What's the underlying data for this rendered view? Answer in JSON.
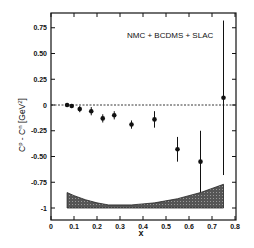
{
  "chart_data": {
    "type": "scatter",
    "title": "",
    "annotation": "NMC + BCDMS + SLAC",
    "xlabel": "x",
    "ylabel": "C^p - C^n [GeV^2]",
    "ylabel_main": "C",
    "ylabel_sup1": "p",
    "ylabel_mid": " - C",
    "ylabel_sup2": "n",
    "ylabel_unit": "[GeV",
    "ylabel_unit_sup": "2",
    "ylabel_unit_close": "]",
    "xlim": [
      0,
      0.8
    ],
    "ylim": [
      -1.1,
      0.92
    ],
    "xticks": [
      0,
      0.1,
      0.2,
      0.3,
      0.4,
      0.5,
      0.6,
      0.7,
      0.8
    ],
    "xtick_labels": [
      "0",
      "0.1",
      "0.2",
      "0.3",
      "0.4",
      "0.5",
      "0.6",
      "0.7",
      "0.8"
    ],
    "yticks": [
      0.75,
      0.5,
      0.25,
      0,
      -0.25,
      -0.5,
      -0.75,
      -1
    ],
    "ytick_labels": [
      "0.75",
      "0.50",
      "0.25",
      "0",
      "-0.25",
      "-0.50",
      "-0.75",
      "-1"
    ],
    "grid": false,
    "reference_line": {
      "y": 0,
      "style": "dashed"
    },
    "series": [
      {
        "name": "NMC + BCDMS + SLAC",
        "x": [
          0.07,
          0.09,
          0.125,
          0.175,
          0.225,
          0.275,
          0.35,
          0.45,
          0.55,
          0.65,
          0.75
        ],
        "y": [
          0.0,
          -0.01,
          -0.04,
          -0.06,
          -0.13,
          -0.1,
          -0.19,
          -0.14,
          -0.43,
          -0.55,
          0.07
        ],
        "yerr": [
          0.02,
          0.02,
          0.03,
          0.04,
          0.04,
          0.04,
          0.04,
          0.08,
          0.12,
          0.3,
          0.75
        ]
      }
    ],
    "systematic_band": {
      "x": [
        0.07,
        0.1,
        0.15,
        0.2,
        0.25,
        0.3,
        0.35,
        0.4,
        0.45,
        0.5,
        0.55,
        0.6,
        0.65,
        0.7,
        0.75
      ],
      "upper": [
        -0.85,
        -0.88,
        -0.92,
        -0.95,
        -0.97,
        -0.97,
        -0.97,
        -0.96,
        -0.95,
        -0.93,
        -0.91,
        -0.88,
        -0.85,
        -0.81,
        -0.77
      ],
      "lower": [
        -1,
        -1,
        -1,
        -1,
        -1,
        -1,
        -1,
        -1,
        -1,
        -1,
        -1,
        -1,
        -1,
        -1,
        -1
      ]
    }
  }
}
